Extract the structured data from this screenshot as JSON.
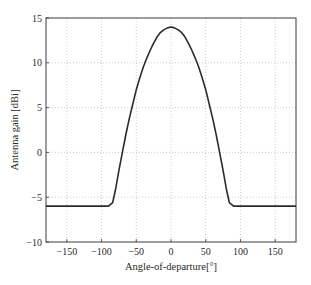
{
  "chart_data": {
    "type": "line",
    "title": "",
    "xlabel": "Angle-of-departure[°]",
    "ylabel": "Antenna gain [dBi]",
    "xlim": [
      -180,
      180
    ],
    "ylim": [
      -10,
      15
    ],
    "xticks": [
      -150,
      -100,
      -50,
      0,
      50,
      100,
      150
    ],
    "yticks": [
      -10,
      -5,
      0,
      5,
      10,
      15
    ],
    "grid": true,
    "legend": null,
    "series": [
      {
        "name": "Antenna gain",
        "x": [
          -180,
          -150,
          -120,
          -90,
          -84,
          -80,
          -75,
          -70,
          -65,
          -60,
          -55,
          -50,
          -45,
          -40,
          -35,
          -30,
          -25,
          -20,
          -15,
          -10,
          -5,
          0,
          5,
          10,
          15,
          20,
          25,
          30,
          35,
          40,
          45,
          50,
          55,
          60,
          65,
          70,
          75,
          80,
          84,
          90,
          120,
          150,
          180
        ],
        "values": [
          -6,
          -6,
          -6,
          -6,
          -5.6,
          -4.2,
          -2.0,
          0.0,
          2.0,
          3.8,
          5.4,
          7.0,
          8.3,
          9.5,
          10.5,
          11.4,
          12.2,
          12.9,
          13.4,
          13.7,
          13.9,
          14,
          13.9,
          13.7,
          13.4,
          12.9,
          12.2,
          11.4,
          10.5,
          9.5,
          8.3,
          7.0,
          5.4,
          3.8,
          2.0,
          0.0,
          -2.0,
          -4.2,
          -5.6,
          -6,
          -6,
          -6,
          -6
        ]
      }
    ]
  }
}
